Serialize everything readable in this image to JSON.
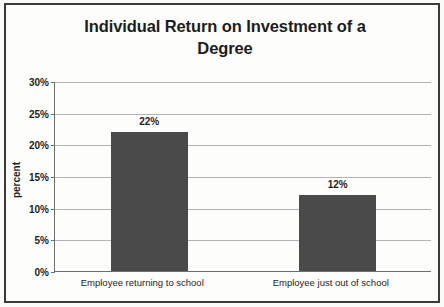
{
  "chart_data": {
    "type": "bar",
    "title": "Individual Return on Investment of a Degree",
    "title_line1": "Individual Return on Investment of a",
    "title_line2": "Degree",
    "categories": [
      "Employee returning to school",
      "Employee just out of school"
    ],
    "values": [
      22,
      12
    ],
    "value_labels": [
      "22%",
      "12%"
    ],
    "xlabel": "",
    "ylabel": "percent",
    "ylim": [
      0,
      30
    ],
    "ytick_values": [
      0,
      5,
      10,
      15,
      20,
      25,
      30
    ],
    "ytick_labels": [
      "0%",
      "5%",
      "10%",
      "15%",
      "20%",
      "25%",
      "30%"
    ],
    "grid": true,
    "legend": false,
    "series_color": "#4a4a4a",
    "gridline_color": "#b3b3b3",
    "axis_color": "#6e6e6e",
    "text_color": "#1d1d1d"
  }
}
